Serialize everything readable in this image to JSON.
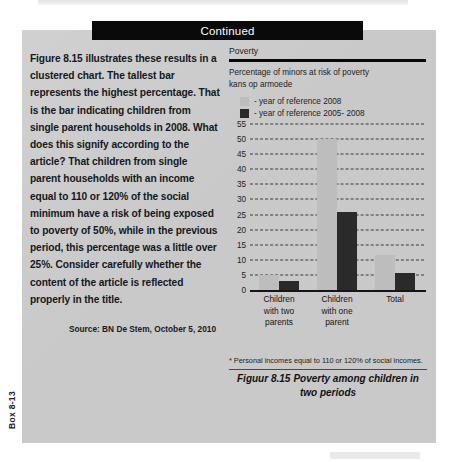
{
  "header": {
    "continued_label": "Continued"
  },
  "side_tab": {
    "label": "Box 8-13"
  },
  "article": {
    "paragraph": "Figure 8.15 illustrates these results in a clustered chart. The tallest bar represents the highest percentage. That is the bar indicating children from single parent households in 2008. What does this signify according to the article? That children from single parent households with an income equal to 110 or 120% of the social minimum have a risk of being exposed to poverty of 50%, while in the previous period, this percentage was a little over 25%. Consider carefully whether the content of the article is reflected properly in the title.",
    "source": "Source: BN De Stem, October 5, 2010"
  },
  "figure": {
    "footnote": "* Personal incomes equal to 110 or 120% of social incomes.",
    "caption_number": "Figuur 8.15",
    "caption_text": "Poverty among children in two periods"
  },
  "colors": {
    "panel_background": "#c9c9c9",
    "header_bar": "#0a0a0a",
    "series_light": "#bdbdbd",
    "series_dark": "#2a2a2a",
    "gridline": "#3b3b3b",
    "axis": "#151515"
  },
  "chart_data": {
    "type": "bar",
    "title": "Poverty",
    "subtitle": "Percentage of minors at risk of poverty kans op armoede",
    "subtitle_lines": [
      "Percentage of minors at risk of poverty",
      "kans op armoede"
    ],
    "categories": [
      "Children with two parents",
      "Children with one parent",
      "Total"
    ],
    "category_lines": [
      [
        "Children",
        "with two",
        "parents"
      ],
      [
        "Children",
        "with one",
        "parent"
      ],
      [
        "Total"
      ]
    ],
    "series": [
      {
        "name": "- year of reference 2008",
        "color": "#bdbdbd",
        "values": [
          5,
          50,
          11.5
        ]
      },
      {
        "name": "- year of reference 2005- 2008",
        "color": "#2a2a2a",
        "values": [
          3,
          26,
          5.5
        ]
      }
    ],
    "ylim": [
      0,
      55
    ],
    "yticks": [
      0,
      5,
      10,
      15,
      20,
      25,
      30,
      35,
      40,
      45,
      50,
      55
    ],
    "ytick_labels": [
      "0",
      "5",
      "10",
      "15",
      "20",
      "25",
      "30",
      "35",
      "40",
      "45",
      "50",
      "55"
    ],
    "xlabel": "",
    "ylabel": "",
    "grid": true,
    "grid_style": "dashed-horizontal",
    "legend_position": "top-left"
  }
}
